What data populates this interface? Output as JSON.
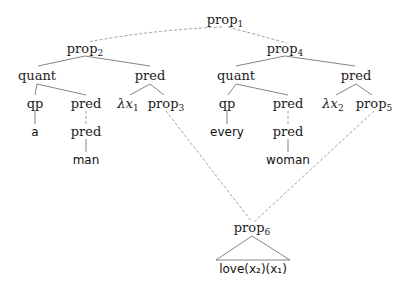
{
  "diagram": {
    "type": "syntax-tree",
    "nodes": {
      "prop1": {
        "label": "prop",
        "sub": "1"
      },
      "prop2": {
        "label": "prop",
        "sub": "2"
      },
      "prop4": {
        "label": "prop",
        "sub": "4"
      },
      "quant_l": {
        "label": "quant"
      },
      "pred_l": {
        "label": "pred"
      },
      "quant_r": {
        "label": "quant"
      },
      "pred_r": {
        "label": "pred"
      },
      "qp_l": {
        "label": "qp"
      },
      "pred_l2": {
        "label": "pred"
      },
      "lambda1": {
        "label": "λx",
        "sub": "1"
      },
      "prop3": {
        "label": "prop",
        "sub": "3"
      },
      "qp_r": {
        "label": "qp"
      },
      "pred_r2": {
        "label": "pred"
      },
      "lambda2": {
        "label": "λx",
        "sub": "2"
      },
      "prop5": {
        "label": "prop",
        "sub": "5"
      },
      "a": {
        "label": "a"
      },
      "pred_l3": {
        "label": "pred"
      },
      "every": {
        "label": "every"
      },
      "pred_r3": {
        "label": "pred"
      },
      "man": {
        "label": "man"
      },
      "woman": {
        "label": "woman"
      },
      "prop6": {
        "label": "prop",
        "sub": "6"
      },
      "love": {
        "label": "love(x₂)(x₁)"
      }
    },
    "edges": [
      {
        "from": "prop1",
        "to": "prop2",
        "style": "dashed"
      },
      {
        "from": "prop1",
        "to": "prop4",
        "style": "dashed"
      },
      {
        "from": "prop2",
        "to": "quant_l",
        "style": "solid"
      },
      {
        "from": "prop2",
        "to": "pred_l",
        "style": "solid"
      },
      {
        "from": "prop4",
        "to": "quant_r",
        "style": "solid"
      },
      {
        "from": "prop4",
        "to": "pred_r",
        "style": "solid"
      },
      {
        "from": "quant_l",
        "to": "qp_l",
        "style": "solid"
      },
      {
        "from": "quant_l",
        "to": "pred_l2",
        "style": "solid"
      },
      {
        "from": "pred_l",
        "to": "lambda1",
        "style": "solid"
      },
      {
        "from": "pred_l",
        "to": "prop3",
        "style": "solid"
      },
      {
        "from": "quant_r",
        "to": "qp_r",
        "style": "solid"
      },
      {
        "from": "quant_r",
        "to": "pred_r2",
        "style": "solid"
      },
      {
        "from": "pred_r",
        "to": "lambda2",
        "style": "solid"
      },
      {
        "from": "pred_r",
        "to": "prop5",
        "style": "solid"
      },
      {
        "from": "qp_l",
        "to": "a",
        "style": "solid"
      },
      {
        "from": "pred_l2",
        "to": "pred_l3",
        "style": "dashed"
      },
      {
        "from": "pred_l3",
        "to": "man",
        "style": "solid"
      },
      {
        "from": "qp_r",
        "to": "every",
        "style": "solid"
      },
      {
        "from": "pred_r2",
        "to": "pred_r3",
        "style": "dashed"
      },
      {
        "from": "pred_r3",
        "to": "woman",
        "style": "solid"
      },
      {
        "from": "prop3",
        "to": "prop6",
        "style": "dashed"
      },
      {
        "from": "prop5",
        "to": "prop6",
        "style": "dashed"
      },
      {
        "from": "prop6",
        "to": "love",
        "style": "triangle"
      }
    ]
  }
}
